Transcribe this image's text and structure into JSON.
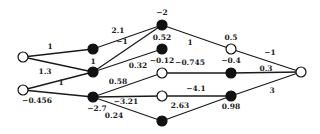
{
  "network": {
    "nodes": [
      {
        "id": "i1",
        "x": 23,
        "y": 57,
        "type": "open"
      },
      {
        "id": "i2",
        "x": 23,
        "y": 90,
        "type": "open"
      },
      {
        "id": "h1a",
        "x": 93,
        "y": 49,
        "type": "filled"
      },
      {
        "id": "h1b",
        "x": 93,
        "y": 72,
        "type": "filled"
      },
      {
        "id": "h1c",
        "x": 93,
        "y": 97,
        "type": "filled"
      },
      {
        "id": "h2a",
        "x": 162,
        "y": 25,
        "type": "filled"
      },
      {
        "id": "h2b",
        "x": 162,
        "y": 49,
        "type": "filled"
      },
      {
        "id": "h2c",
        "x": 162,
        "y": 73,
        "type": "open"
      },
      {
        "id": "h2d",
        "x": 162,
        "y": 96,
        "type": "open"
      },
      {
        "id": "h2e",
        "x": 162,
        "y": 121,
        "type": "filled"
      },
      {
        "id": "h3a",
        "x": 231,
        "y": 49,
        "type": "open"
      },
      {
        "id": "h3b",
        "x": 231,
        "y": 73,
        "type": "filled"
      },
      {
        "id": "h3c",
        "x": 231,
        "y": 96,
        "type": "filled"
      },
      {
        "id": "o1",
        "x": 301,
        "y": 72,
        "type": "open"
      }
    ],
    "edges": [
      {
        "from": "i1",
        "to": "h1a",
        "label": "1",
        "lx": 50,
        "ly": 49
      },
      {
        "from": "i1",
        "to": "h1b",
        "label": "1.3",
        "lx": 45,
        "ly": 74
      },
      {
        "from": "i2",
        "to": "h1b",
        "label": "1",
        "lx": 61,
        "ly": 85
      },
      {
        "from": "i2",
        "to": "h1c",
        "label": "−0.456",
        "lx": 37,
        "ly": 103
      },
      {
        "from": "h1a",
        "to": "h2a",
        "label": "2.1",
        "lx": 118,
        "ly": 33
      },
      {
        "from": "h1b",
        "to": "h2a",
        "label": "−1",
        "lx": 122,
        "ly": 44
      },
      {
        "from": "h1b",
        "to": "h2b",
        "label": "0.32",
        "lx": 138,
        "ly": 68
      },
      {
        "from": "h1c",
        "to": "h2c",
        "label": "0.58",
        "lx": 118,
        "ly": 84
      },
      {
        "from": "h1c",
        "to": "h2d",
        "label": "−3.21",
        "lx": 126,
        "ly": 104
      },
      {
        "from": "h1c",
        "to": "h2e",
        "label": "0.24",
        "lx": 114,
        "ly": 118
      },
      {
        "from": "h2a",
        "to": "h3a",
        "label": "1",
        "lx": 190,
        "ly": 45
      },
      {
        "from": "h2c",
        "to": "h3b",
        "label": "−0.745",
        "lx": 190,
        "ly": 65
      },
      {
        "from": "h2d",
        "to": "h3c",
        "label": "−4.1",
        "lx": 196,
        "ly": 91
      },
      {
        "from": "h2e",
        "to": "h3c",
        "label": "2.63",
        "lx": 180,
        "ly": 108
      },
      {
        "from": "h3a",
        "to": "o1",
        "label": "−1",
        "lx": 270,
        "ly": 55
      },
      {
        "from": "h3b",
        "to": "o1",
        "label": "0.3",
        "lx": 266,
        "ly": 71
      },
      {
        "from": "h3c",
        "to": "o1",
        "label": "3",
        "lx": 272,
        "ly": 93
      }
    ],
    "node_labels": [
      {
        "node": "h1b",
        "label": "1",
        "lx": 93,
        "ly": 64
      },
      {
        "node": "h1c",
        "label": "−2.7",
        "lx": 97,
        "ly": 111
      },
      {
        "node": "h2a",
        "label": "−2",
        "lx": 162,
        "ly": 15
      },
      {
        "node": "h2b",
        "label": "0.52",
        "lx": 162,
        "ly": 40
      },
      {
        "node": "h2c",
        "label": "−0.12",
        "lx": 162,
        "ly": 63
      },
      {
        "node": "h3a",
        "label": "0.5",
        "lx": 231,
        "ly": 40
      },
      {
        "node": "h3b",
        "label": "−0.4",
        "lx": 231,
        "ly": 63
      },
      {
        "node": "h3c",
        "label": "0.98",
        "lx": 231,
        "ly": 109
      }
    ]
  }
}
